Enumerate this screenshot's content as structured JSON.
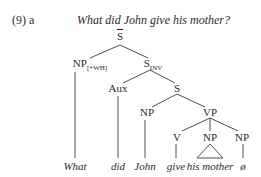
{
  "example": {
    "number": "(9) a",
    "question": "What did John give his mother?"
  },
  "tree": {
    "root": {
      "label": "S",
      "bar": true
    },
    "np_wh": {
      "label": "NP",
      "subscript": "[+WH]"
    },
    "s_inv": {
      "label": "S",
      "subscript": "INV"
    },
    "aux": {
      "label": "Aux"
    },
    "s": {
      "label": "S"
    },
    "np_subj": {
      "label": "NP"
    },
    "vp": {
      "label": "VP"
    },
    "v": {
      "label": "V"
    },
    "np_obj1": {
      "label": "NP",
      "triangle": true
    },
    "np_obj2": {
      "label": "NP"
    }
  },
  "leaves": [
    "What",
    "did",
    "John",
    "give",
    "his mother",
    "ø"
  ],
  "colors": {
    "ink": "#2a2a2a",
    "background": "#ffffff"
  }
}
